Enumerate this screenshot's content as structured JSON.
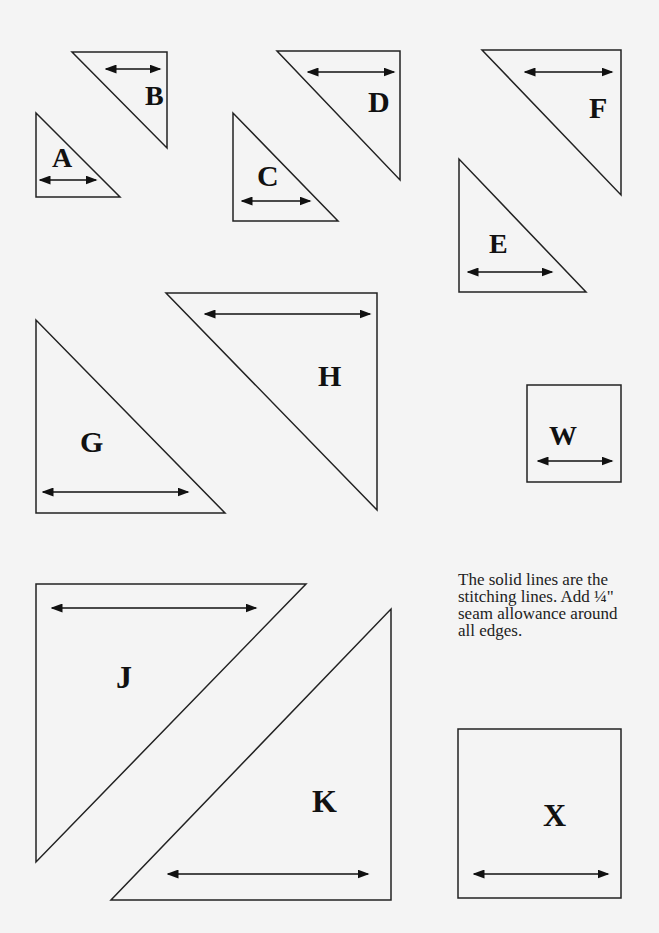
{
  "pieces": [
    {
      "id": "A",
      "points": "36,113 36,197 120,197",
      "label_x": 52,
      "label_y": 167,
      "font": 28,
      "arrow": [
        40,
        96,
        180
      ]
    },
    {
      "id": "B",
      "points": "72,52 167,52 167,148",
      "label_x": 145,
      "label_y": 105,
      "font": 28,
      "arrow": [
        106,
        160,
        69
      ]
    },
    {
      "id": "C",
      "points": "233,113 233,221 338,221",
      "label_x": 257,
      "label_y": 186,
      "font": 30,
      "arrow": [
        242,
        310,
        201
      ]
    },
    {
      "id": "D",
      "points": "277,51 400,51 400,180",
      "label_x": 368,
      "label_y": 112,
      "font": 30,
      "arrow": [
        308,
        394,
        72
      ]
    },
    {
      "id": "E",
      "points": "459,159 459,292 586,292",
      "label_x": 489,
      "label_y": 253,
      "font": 28,
      "arrow": [
        468,
        552,
        272
      ]
    },
    {
      "id": "F",
      "points": "482,50 621,50 621,195",
      "label_x": 589,
      "label_y": 118,
      "font": 30,
      "arrow": [
        525,
        612,
        72
      ]
    },
    {
      "id": "G",
      "points": "36,320 36,513 225,513",
      "label_x": 80,
      "label_y": 452,
      "font": 30,
      "arrow": [
        43,
        188,
        492
      ]
    },
    {
      "id": "H",
      "points": "166,293 377,293 377,510",
      "label_x": 318,
      "label_y": 386,
      "font": 30,
      "arrow": [
        205,
        370,
        314
      ]
    },
    {
      "id": "J",
      "points": "36,584 306,584 36,862",
      "label_x": 116,
      "label_y": 688,
      "font": 32,
      "arrow": [
        52,
        256,
        608
      ]
    },
    {
      "id": "K",
      "points": "391,609 391,900 111,900",
      "label_x": 312,
      "label_y": 812,
      "font": 32,
      "arrow": [
        168,
        368,
        874
      ]
    }
  ],
  "squares": [
    {
      "id": "W",
      "x": 527,
      "y": 385,
      "w": 94,
      "h": 97,
      "label_x": 549,
      "label_y": 445,
      "font": 28,
      "arrow": [
        538,
        612,
        461
      ]
    },
    {
      "id": "X",
      "x": 458,
      "y": 729,
      "w": 163,
      "h": 169,
      "label_x": 543,
      "label_y": 826,
      "font": 32,
      "arrow": [
        474,
        608,
        874
      ]
    }
  ],
  "note": {
    "lines": [
      "The solid lines are the",
      "stitching lines. Add ¼\"",
      "seam allowance around",
      "all edges."
    ]
  },
  "colors": {
    "background": "#f4f4f4",
    "stroke": "#222222"
  }
}
